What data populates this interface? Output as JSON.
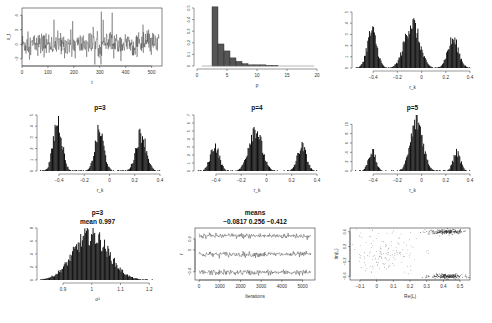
{
  "chart_data": [
    {
      "id": "trace-L",
      "type": "line",
      "title": "",
      "xlabel": "t",
      "ylabel": "x_t",
      "xlim": [
        0,
        540
      ],
      "ylim": [
        -3,
        5
      ],
      "xticks": [
        0,
        100,
        200,
        300,
        400,
        500
      ],
      "yticks": [
        -2,
        0,
        2,
        4
      ],
      "description": "time series noise around 0, spikes up to ~4"
    },
    {
      "id": "hist-p",
      "type": "bar",
      "title": "",
      "xlabel": "p",
      "ylabel": "",
      "xlim": [
        0,
        20
      ],
      "ylim": [
        0,
        0.5
      ],
      "xticks": [
        0,
        5,
        10,
        15,
        20
      ],
      "yticks": [
        0.0,
        0.1,
        0.2,
        0.3,
        0.4,
        0.5
      ],
      "categories": [
        3,
        4,
        5,
        6,
        7,
        8,
        9,
        10,
        11,
        12,
        13
      ],
      "values": [
        0.51,
        0.19,
        0.13,
        0.07,
        0.04,
        0.02,
        0.01,
        0.01,
        0.01,
        0.005,
        0.005
      ]
    },
    {
      "id": "hist-all",
      "type": "bar",
      "title": "",
      "xlabel": "r_k",
      "ylabel": "",
      "xlim": [
        -0.55,
        0.4
      ],
      "ylim": [
        0,
        5
      ],
      "xticks": [
        -0.4,
        -0.2,
        0.0,
        0.2,
        0.4
      ],
      "yticks": [
        0,
        1,
        2,
        3,
        4,
        5
      ],
      "modes": [
        {
          "center": -0.41,
          "height": 3.5,
          "width": 0.04
        },
        {
          "center": -0.08,
          "height": 4.3,
          "width": 0.06
        },
        {
          "center": 0.26,
          "height": 2.7,
          "width": 0.045
        }
      ]
    },
    {
      "id": "hist-p3",
      "type": "bar",
      "title": "p=3",
      "xlabel": "r_k",
      "ylabel": "",
      "xlim": [
        -0.55,
        0.4
      ],
      "ylim": [
        0,
        5
      ],
      "xticks": [
        -0.4,
        -0.2,
        0.0,
        0.2,
        0.4
      ],
      "yticks": [
        0,
        1,
        2,
        3,
        4,
        5
      ],
      "modes": [
        {
          "center": -0.41,
          "height": 4.8,
          "width": 0.035
        },
        {
          "center": -0.08,
          "height": 3.8,
          "width": 0.035
        },
        {
          "center": 0.25,
          "height": 3.6,
          "width": 0.04
        }
      ]
    },
    {
      "id": "hist-p4",
      "type": "bar",
      "title": "p=4",
      "xlabel": "r_k",
      "ylabel": "",
      "xlim": [
        -0.55,
        0.4
      ],
      "ylim": [
        0,
        7
      ],
      "xticks": [
        -0.4,
        -0.2,
        0.0,
        0.2,
        0.4
      ],
      "yticks": [
        0,
        1,
        2,
        3,
        4,
        5,
        6,
        7
      ],
      "modes": [
        {
          "center": -0.41,
          "height": 3.4,
          "width": 0.035
        },
        {
          "center": -0.09,
          "height": 5.8,
          "width": 0.05
        },
        {
          "center": 0.28,
          "height": 3.3,
          "width": 0.035
        }
      ]
    },
    {
      "id": "hist-p5",
      "type": "bar",
      "title": "p=5",
      "xlabel": "r_k",
      "ylabel": "",
      "xlim": [
        -0.55,
        0.4
      ],
      "ylim": [
        0,
        12
      ],
      "xticks": [
        -0.4,
        -0.2,
        0.0,
        0.2,
        0.4
      ],
      "yticks": [
        0,
        2,
        4,
        6,
        8,
        10
      ],
      "modes": [
        {
          "center": -0.41,
          "height": 4.5,
          "width": 0.03
        },
        {
          "center": -0.04,
          "height": 11.5,
          "width": 0.05
        },
        {
          "center": 0.29,
          "height": 4.2,
          "width": 0.03
        }
      ]
    },
    {
      "id": "hist-sigma",
      "type": "bar",
      "title": "p=3",
      "subtitle": "mean 0.997",
      "xlabel": "σ²",
      "ylabel": "",
      "xlim": [
        0.82,
        1.22
      ],
      "ylim": [
        0,
        8
      ],
      "xticks": [
        0.9,
        1.0,
        1.1,
        1.2
      ],
      "yticks": [
        0,
        2,
        4,
        6,
        8
      ],
      "modes": [
        {
          "center": 0.997,
          "height": 7.5,
          "width": 0.06
        }
      ]
    },
    {
      "id": "trace-means",
      "type": "line",
      "title": "means",
      "subtitle": "−0.0817   0.256   −0.412",
      "xlabel": "Iterations",
      "ylabel": "r",
      "xlim": [
        -200,
        5600
      ],
      "ylim": [
        -0.55,
        0.4
      ],
      "xticks": [
        0,
        1000,
        2000,
        3000,
        4000,
        5000
      ],
      "yticks": [
        -0.4,
        0.0,
        0.2
      ],
      "series": [
        {
          "name": "r1",
          "mean": 0.256
        },
        {
          "name": "r2",
          "mean": -0.0817
        },
        {
          "name": "r3",
          "mean": -0.412
        }
      ]
    },
    {
      "id": "scatter-roots",
      "type": "scatter",
      "title": "",
      "xlabel": "Re(L)",
      "ylabel": "Im(L)",
      "xlim": [
        -0.16,
        0.56
      ],
      "ylim": [
        -0.7,
        0.7
      ],
      "xticks": [
        -0.1,
        0.0,
        0.1,
        0.2,
        0.3,
        0.4,
        0.5
      ],
      "yticks": [
        -0.6,
        -0.2,
        0.2,
        0.6
      ],
      "clusters": [
        {
          "cx": 0.42,
          "cy": 0.6,
          "sx": 0.05,
          "sy": 0.03,
          "n": 220
        },
        {
          "cx": 0.42,
          "cy": -0.6,
          "sx": 0.05,
          "sy": 0.03,
          "n": 220
        },
        {
          "cx": 0.05,
          "cy": 0.0,
          "sx": 0.1,
          "sy": 0.3,
          "n": 160
        }
      ]
    }
  ]
}
